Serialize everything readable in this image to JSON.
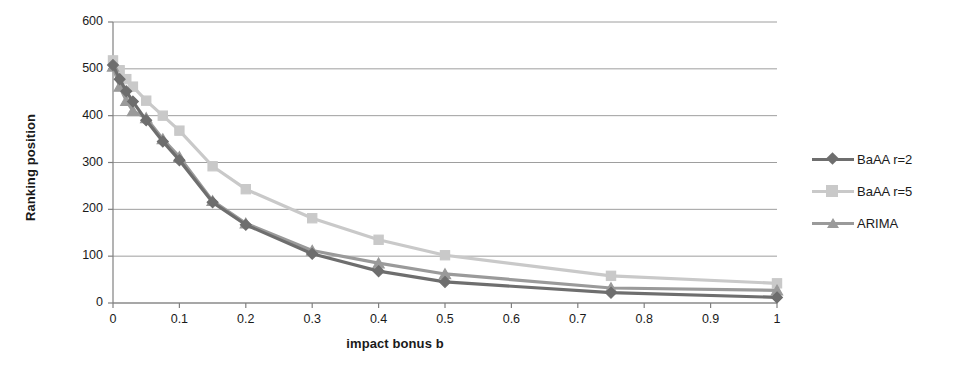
{
  "chart_data": {
    "type": "line",
    "title": "",
    "xlabel": "impact bonus b",
    "ylabel": "Ranking position",
    "xlim": [
      0,
      1
    ],
    "ylim": [
      0,
      600
    ],
    "xticks": [
      "0",
      "0.1",
      "0.2",
      "0.3",
      "0.4",
      "0.5",
      "0.6",
      "0.7",
      "0.8",
      "0.9",
      "1"
    ],
    "xtick_values": [
      0,
      0.1,
      0.2,
      0.3,
      0.4,
      0.5,
      0.6,
      0.7,
      0.8,
      0.9,
      1
    ],
    "yticks": [
      "0",
      "100",
      "200",
      "300",
      "400",
      "500",
      "600"
    ],
    "ytick_values": [
      0,
      100,
      200,
      300,
      400,
      500,
      600
    ],
    "grid": "horizontal",
    "legend_position": "right",
    "x": [
      0,
      0.01,
      0.02,
      0.03,
      0.05,
      0.075,
      0.1,
      0.15,
      0.2,
      0.3,
      0.4,
      0.5,
      0.75,
      1
    ],
    "series": [
      {
        "name": "BaAA r=2",
        "marker": "diamond",
        "color": "#6e6e6e",
        "values": [
          508,
          478,
          452,
          430,
          390,
          345,
          305,
          215,
          167,
          105,
          68,
          45,
          22,
          12
        ]
      },
      {
        "name": "BaAA r=5",
        "marker": "square",
        "color": "#c9c9c9",
        "values": [
          518,
          497,
          478,
          462,
          432,
          400,
          368,
          292,
          243,
          181,
          135,
          102,
          58,
          42
        ]
      },
      {
        "name": "ARIMA",
        "marker": "triangle",
        "color": "#9a9a9a",
        "values": [
          505,
          462,
          432,
          410,
          395,
          350,
          312,
          218,
          170,
          112,
          85,
          62,
          32,
          27
        ]
      }
    ]
  },
  "legend": {
    "items": [
      {
        "label": "BaAA r=2"
      },
      {
        "label": "BaAA r=5"
      },
      {
        "label": "ARIMA"
      }
    ]
  },
  "colors": {
    "axis": "#808080",
    "grid": "#9e9e9e",
    "text": "#1a1a1a",
    "series_1": "#6e6e6e",
    "series_2": "#c9c9c9",
    "series_3": "#9a9a9a"
  }
}
